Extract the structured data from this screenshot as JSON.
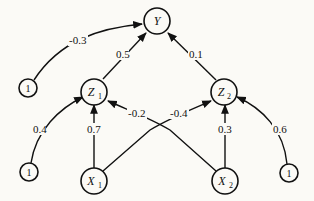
{
  "diagram": {
    "type": "neural-network",
    "nodes": {
      "Y": {
        "label": "Y",
        "sub": ""
      },
      "Z1": {
        "label": "Z",
        "sub": "1"
      },
      "Z2": {
        "label": "Z",
        "sub": "2"
      },
      "X1": {
        "label": "X",
        "sub": "1"
      },
      "X2": {
        "label": "X",
        "sub": "2"
      },
      "biasY": {
        "label": "1"
      },
      "biasZ1": {
        "label": "1"
      },
      "biasZ2": {
        "label": "1"
      }
    },
    "edges": [
      {
        "from": "biasY",
        "to": "Y",
        "weight": "-0.3"
      },
      {
        "from": "Z1",
        "to": "Y",
        "weight": "0.5"
      },
      {
        "from": "Z2",
        "to": "Y",
        "weight": "0.1"
      },
      {
        "from": "biasZ1",
        "to": "Z1",
        "weight": "0.4"
      },
      {
        "from": "X1",
        "to": "Z1",
        "weight": "0.7"
      },
      {
        "from": "X2",
        "to": "Z1",
        "weight": "-0.2"
      },
      {
        "from": "X1",
        "to": "Z2",
        "weight": "-0.4"
      },
      {
        "from": "X2",
        "to": "Z2",
        "weight": "0.3"
      },
      {
        "from": "biasZ2",
        "to": "Z2",
        "weight": "0.6"
      }
    ]
  }
}
